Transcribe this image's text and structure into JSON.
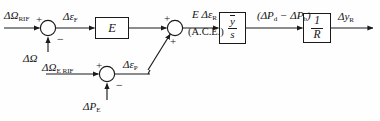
{
  "diagram": {
    "background_color": "#fefefe",
    "line_color": "#1a1a1a",
    "text_color": "#141414",
    "signals": {
      "omega_rif": "ΔΩ",
      "omega_rif_sub": "RIF",
      "delta_omega": "ΔΩ",
      "eps_f": "Δε",
      "eps_f_sub": "F",
      "ace_main": "E Δε",
      "ace_main_sub": "R",
      "ace_paren": "(A.C.E.)",
      "power_diff": "(ΔP",
      "power_diff_sub1": "d",
      "power_diff_mid": " − ΔP",
      "power_diff_sub2": "b",
      "power_diff_end": ")",
      "output": "Δy",
      "output_sub": "R",
      "omega_e_rif": "ΔΩ",
      "omega_e_rif_sub": "E RIF",
      "eps_p": "Δε",
      "eps_p_sub": "P",
      "delta_p_e": "ΔP",
      "delta_p_e_sub": "E"
    },
    "blocks": [
      {
        "id": "gain-e",
        "label": "E"
      },
      {
        "id": "integrator",
        "numerator": "y",
        "denominator": "s",
        "overbar": true
      },
      {
        "id": "droop",
        "numerator": "1",
        "denominator": "R",
        "overbar": false
      }
    ],
    "summers": [
      {
        "id": "summer-1",
        "sign_left": "+",
        "sign_bottom": "−"
      },
      {
        "id": "summer-2",
        "sign_top": "+",
        "sign_bottom": "+"
      },
      {
        "id": "summer-3",
        "sign_left": "+",
        "sign_bottom": "−"
      }
    ]
  }
}
